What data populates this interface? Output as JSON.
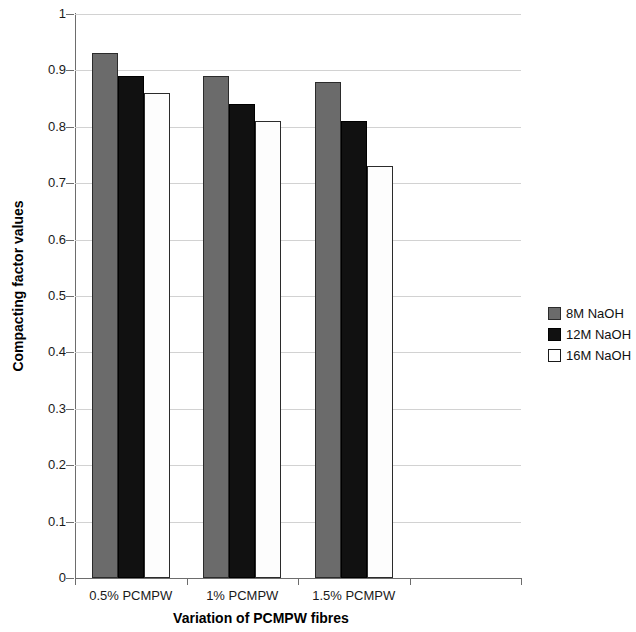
{
  "chart_data": {
    "type": "bar",
    "title": "",
    "xlabel": "Variation of PCMPW fibres",
    "ylabel": "Compacting factor values",
    "categories": [
      "0.5% PCMPW",
      "1% PCMPW",
      "1.5% PCMPW"
    ],
    "series": [
      {
        "name": "8M NaOH",
        "values": [
          0.93,
          0.89,
          0.88
        ],
        "color": "#6b6b6b"
      },
      {
        "name": "12M NaOH",
        "values": [
          0.89,
          0.84,
          0.81
        ],
        "color": "#111111"
      },
      {
        "name": "16M NaOH",
        "values": [
          0.86,
          0.81,
          0.73
        ],
        "color": "#ffffff"
      }
    ],
    "ylim": [
      0,
      1
    ],
    "ytick_labels": [
      "1",
      "0.9",
      "0.8",
      "0.7",
      "0.6",
      "0.5",
      "0.4",
      "0.3",
      "0.2",
      "0.1",
      "0"
    ],
    "ytick_values": [
      1,
      0.9,
      0.8,
      0.7,
      0.6,
      0.5,
      0.4,
      0.3,
      0.2,
      0.1,
      0
    ],
    "grid": true,
    "legend_position": "right",
    "empty_trailing_category_slot": true
  },
  "axes": {
    "y_title": "Compacting factor values",
    "x_title": "Variation of PCMPW fibres"
  },
  "legend": {
    "entries": [
      {
        "label": "8M NaOH"
      },
      {
        "label": "12M NaOH"
      },
      {
        "label": "16M NaOH"
      }
    ]
  }
}
